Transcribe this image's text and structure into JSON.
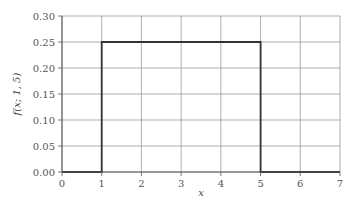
{
  "chart_data": {
    "type": "line",
    "title": "",
    "xlabel": "x",
    "ylabel": "f(x; 1, 5)",
    "xlim": [
      0,
      7
    ],
    "ylim": [
      0,
      0.3
    ],
    "grid": true,
    "x_ticks": [
      "0",
      "1",
      "2",
      "3",
      "4",
      "5",
      "6",
      "7"
    ],
    "y_ticks": [
      "0.00",
      "0.05",
      "0.10",
      "0.15",
      "0.20",
      "0.25",
      "0.30"
    ],
    "series": [
      {
        "name": "uniform pdf a=1, b=5",
        "x": [
          0,
          1,
          1,
          5,
          5,
          7
        ],
        "y": [
          0,
          0,
          0.25,
          0.25,
          0,
          0
        ]
      }
    ]
  }
}
